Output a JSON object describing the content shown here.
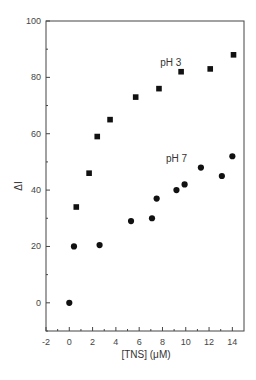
{
  "chart_data": {
    "type": "scatter",
    "title": "",
    "xlabel": "[TNS] (μM)",
    "ylabel": "ΔI",
    "xlim": [
      -2,
      15
    ],
    "ylim": [
      -10,
      100
    ],
    "xticks": [
      -2,
      0,
      2,
      4,
      6,
      8,
      10,
      12,
      14
    ],
    "yticks": [
      0,
      20,
      40,
      60,
      80,
      100
    ],
    "grid": false,
    "legend": null,
    "series": [
      {
        "name": "pH 3",
        "marker": "square",
        "color": "#111111",
        "x": [
          0.6,
          1.7,
          2.4,
          3.5,
          5.7,
          7.7,
          9.6,
          12.1,
          14.1
        ],
        "y": [
          34,
          46,
          59,
          65,
          73,
          76,
          82,
          83,
          88
        ]
      },
      {
        "name": "pH 7",
        "marker": "circle",
        "color": "#111111",
        "x": [
          0.0,
          0.4,
          2.6,
          5.3,
          7.1,
          7.5,
          9.2,
          9.9,
          11.3,
          13.1,
          14.0
        ],
        "y": [
          0,
          20,
          20.5,
          29,
          30,
          37,
          40,
          42,
          48,
          45,
          52
        ]
      }
    ],
    "annotations": [
      {
        "text": "pH 3",
        "x": 7.8,
        "y": 84
      },
      {
        "text": "pH 7",
        "x": 8.3,
        "y": 50
      }
    ]
  }
}
